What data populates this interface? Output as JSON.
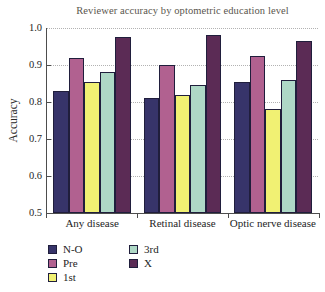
{
  "chart_data": {
    "type": "bar",
    "title": "Reviewer accuracy by optometric education level",
    "ylabel": "Accuracy",
    "xlabel": "",
    "ylim": [
      0.5,
      1.0
    ],
    "yticks": [
      0.5,
      0.6,
      0.7,
      0.8,
      0.9,
      1.0
    ],
    "grid": "horizontal dotted gridlines at 0.6-1.0",
    "categories": [
      "Any disease",
      "Retinal disease",
      "Optic nerve disease"
    ],
    "series": [
      {
        "name": "N-O",
        "color": "#37346a",
        "values": [
          0.83,
          0.81,
          0.855
        ]
      },
      {
        "name": "Pre",
        "color": "#b16190",
        "values": [
          0.92,
          0.9,
          0.925
        ]
      },
      {
        "name": "1st",
        "color": "#f1f173",
        "values": [
          0.855,
          0.82,
          0.78
        ]
      },
      {
        "name": "3rd",
        "color": "#aed8c6",
        "values": [
          0.88,
          0.845,
          0.86
        ]
      },
      {
        "name": "X",
        "color": "#5b2b55",
        "values": [
          0.975,
          0.98,
          0.965
        ]
      }
    ],
    "legend_position": "bottom-left, two columns",
    "legend_columns": [
      [
        "N-O",
        "Pre",
        "1st"
      ],
      [
        "3rd",
        "X"
      ]
    ],
    "style_colors": {
      "axis": "#4d4d4d",
      "gridline": "#b2b2b2",
      "bar_border": "#201e3c",
      "title_text": "#5a564e",
      "tick_text": "#1e1e1e",
      "background": "#ffffff"
    }
  }
}
